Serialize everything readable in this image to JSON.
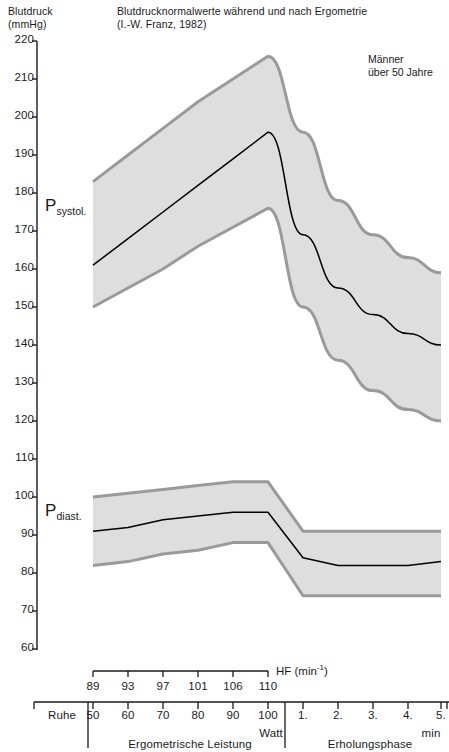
{
  "figure": {
    "title_line1": "Blutdrucknormalwerte  während und nach Ergometrie",
    "title_line2": "(I.-W. Franz, 1982)",
    "y_axis_label_line1": "Blutdruck",
    "y_axis_label_line2": "(mmHg)",
    "annotation_line1": "Männer",
    "annotation_line2": "über 50 Jahre",
    "systolic_label_main": "P",
    "systolic_label_sub": "systol.",
    "diastolic_label_main": "P",
    "diastolic_label_sub": "diast.",
    "hf_unit_text": "HF (min",
    "hf_unit_sup": "-1",
    "hf_unit_close": ")",
    "rest_label": "Ruhe",
    "watt_label": "Watt",
    "min_label": "min",
    "section_exercise": "Ergometrische Leistung",
    "section_recovery": "Erholungsphase",
    "band_fill_color": "#dedede",
    "band_edge_color": "#9a9a9a",
    "mean_line_color": "#000000",
    "axis_color": "#1a1a1a"
  },
  "chart_data": {
    "type": "area",
    "title": "Blutdrucknormalwerte während und nach Ergometrie (I.-W. Franz, 1982)",
    "subtitle": "Männer über 50 Jahre",
    "xlabel": "Ergometrische Leistung / Erholungsphase",
    "ylabel": "Blutdruck (mmHg)",
    "ylim": [
      60,
      220
    ],
    "yticks": [
      220,
      210,
      200,
      190,
      180,
      170,
      160,
      150,
      140,
      130,
      120,
      110,
      100,
      90,
      80,
      70,
      60
    ],
    "grid": false,
    "legend": false,
    "x_categories": [
      "Ruhe",
      "50",
      "60",
      "70",
      "80",
      "90",
      "100",
      "1.",
      "2.",
      "3.",
      "4.",
      "5."
    ],
    "x_axis_groups": [
      {
        "label": "Ergometrische Leistung",
        "unit": "Watt",
        "ticks": [
          "50",
          "60",
          "70",
          "80",
          "90",
          "100"
        ]
      },
      {
        "label": "Erholungsphase",
        "unit": "min",
        "ticks": [
          "1.",
          "2.",
          "3.",
          "4.",
          "5."
        ]
      }
    ],
    "hf_row": {
      "label": "HF (min-1)",
      "values": [
        "89",
        "93",
        "97",
        "101",
        "106",
        "110"
      ]
    },
    "series": [
      {
        "name": "P systol.",
        "x": [
          "50",
          "60",
          "70",
          "80",
          "90",
          "100",
          "1.",
          "2.",
          "3.",
          "4.",
          "5."
        ],
        "mean": [
          161,
          168,
          175,
          182,
          189,
          196,
          169,
          155,
          148,
          143,
          140
        ],
        "upper": [
          183,
          190,
          197,
          204,
          210,
          216,
          196,
          178,
          169,
          163,
          159
        ],
        "lower": [
          150,
          155,
          160,
          166,
          171,
          176,
          150,
          136,
          128,
          123,
          120
        ]
      },
      {
        "name": "P diast.",
        "x": [
          "50",
          "60",
          "70",
          "80",
          "90",
          "100",
          "1.",
          "2.",
          "3.",
          "4.",
          "5."
        ],
        "mean": [
          91,
          92,
          94,
          95,
          96,
          96,
          84,
          82,
          82,
          82,
          83
        ],
        "upper": [
          100,
          101,
          102,
          103,
          104,
          104,
          91,
          91,
          91,
          91,
          91
        ],
        "lower": [
          82,
          83,
          85,
          86,
          88,
          88,
          74,
          74,
          74,
          74,
          74
        ]
      }
    ]
  }
}
